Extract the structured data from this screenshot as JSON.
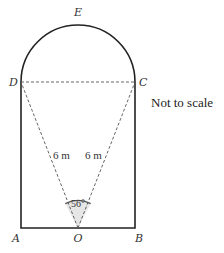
{
  "diagram": {
    "points": {
      "A": {
        "label": "A"
      },
      "B": {
        "label": "B"
      },
      "C": {
        "label": "C"
      },
      "D": {
        "label": "D"
      },
      "E": {
        "label": "E"
      },
      "O": {
        "label": "O"
      }
    },
    "lengths": {
      "OD": "6 m",
      "OC": "6 m"
    },
    "angle": {
      "DOC": "56°"
    },
    "note": "Not to scale",
    "colors": {
      "outline": "#222222",
      "dashed": "#555555",
      "angle_fill": "#e6e6e6"
    }
  }
}
